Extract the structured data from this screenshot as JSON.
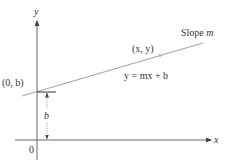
{
  "diagram": {
    "type": "slope-intercept line diagram",
    "axes": {
      "x_label": "x",
      "y_label": "y",
      "origin_label": "0"
    },
    "line": {
      "equation_label": "y = mx + b",
      "slope_label_prefix": "Slope",
      "slope_label_var": "m",
      "point_label": "(x, y)",
      "intercept_label": "(0, b)"
    },
    "dimension": {
      "label": "b"
    },
    "colors": {
      "axis": "#555555",
      "line": "#a0a0a0",
      "text": "#333333",
      "background": "#ffffff"
    }
  }
}
